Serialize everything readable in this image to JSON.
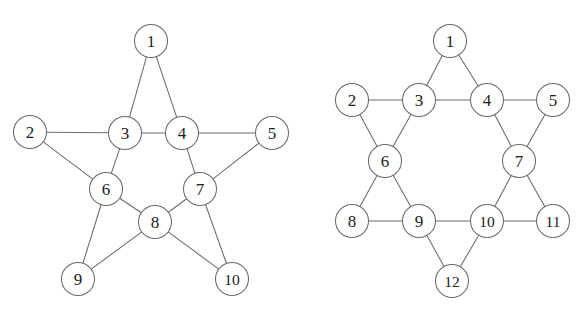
{
  "figure": {
    "background_color": "#ffffff",
    "stroke_color": "#6b6b63",
    "label_color": "#1c1c1c",
    "caption_partial": ""
  },
  "graphs": [
    {
      "id": "left-graph",
      "name": "five-pointed-star-graph",
      "node_radius": 16.5,
      "nodes": [
        {
          "id": "1",
          "label": "1",
          "x": 151,
          "y": 41
        },
        {
          "id": "2",
          "label": "2",
          "x": 30,
          "y": 132
        },
        {
          "id": "3",
          "label": "3",
          "x": 125,
          "y": 133
        },
        {
          "id": "4",
          "label": "4",
          "x": 182,
          "y": 133
        },
        {
          "id": "5",
          "label": "5",
          "x": 272,
          "y": 133
        },
        {
          "id": "6",
          "label": "6",
          "x": 106,
          "y": 189
        },
        {
          "id": "7",
          "label": "7",
          "x": 200,
          "y": 189
        },
        {
          "id": "8",
          "label": "8",
          "x": 155,
          "y": 222
        },
        {
          "id": "9",
          "label": "9",
          "x": 78,
          "y": 279
        },
        {
          "id": "10",
          "label": "10",
          "x": 232,
          "y": 279
        }
      ],
      "edges": [
        [
          "1",
          "3"
        ],
        [
          "1",
          "4"
        ],
        [
          "2",
          "3"
        ],
        [
          "2",
          "6"
        ],
        [
          "3",
          "4"
        ],
        [
          "3",
          "6"
        ],
        [
          "4",
          "5"
        ],
        [
          "4",
          "7"
        ],
        [
          "5",
          "7"
        ],
        [
          "6",
          "8"
        ],
        [
          "6",
          "9"
        ],
        [
          "7",
          "8"
        ],
        [
          "7",
          "10"
        ],
        [
          "8",
          "9"
        ],
        [
          "8",
          "10"
        ]
      ]
    },
    {
      "id": "right-graph",
      "name": "six-pointed-star-graph",
      "node_radius": 16.5,
      "nodes": [
        {
          "id": "1",
          "label": "1",
          "x": 450,
          "y": 41
        },
        {
          "id": "2",
          "label": "2",
          "x": 352,
          "y": 100
        },
        {
          "id": "3",
          "label": "3",
          "x": 419,
          "y": 100
        },
        {
          "id": "4",
          "label": "4",
          "x": 487,
          "y": 100
        },
        {
          "id": "5",
          "label": "5",
          "x": 553,
          "y": 100
        },
        {
          "id": "6",
          "label": "6",
          "x": 385,
          "y": 161
        },
        {
          "id": "7",
          "label": "7",
          "x": 519,
          "y": 161
        },
        {
          "id": "8",
          "label": "8",
          "x": 352,
          "y": 221
        },
        {
          "id": "9",
          "label": "9",
          "x": 419,
          "y": 221
        },
        {
          "id": "10",
          "label": "10",
          "x": 487,
          "y": 221
        },
        {
          "id": "11",
          "label": "11",
          "x": 553,
          "y": 221
        },
        {
          "id": "12",
          "label": "12",
          "x": 452,
          "y": 281
        }
      ],
      "edges": [
        [
          "1",
          "3"
        ],
        [
          "1",
          "4"
        ],
        [
          "2",
          "3"
        ],
        [
          "2",
          "6"
        ],
        [
          "3",
          "4"
        ],
        [
          "3",
          "6"
        ],
        [
          "4",
          "5"
        ],
        [
          "4",
          "7"
        ],
        [
          "5",
          "7"
        ],
        [
          "6",
          "8"
        ],
        [
          "6",
          "9"
        ],
        [
          "7",
          "10"
        ],
        [
          "7",
          "11"
        ],
        [
          "8",
          "9"
        ],
        [
          "9",
          "10"
        ],
        [
          "9",
          "12"
        ],
        [
          "10",
          "11"
        ],
        [
          "10",
          "12"
        ]
      ]
    }
  ]
}
